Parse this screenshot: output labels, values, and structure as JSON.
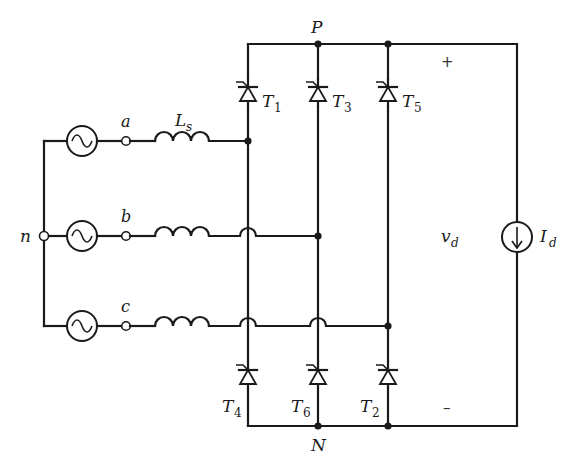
{
  "diagram": {
    "nodes": {
      "positive_rail": "P",
      "negative_rail": "N",
      "neutral": "n",
      "phase_a": "a",
      "phase_b": "b",
      "phase_c": "c"
    },
    "inductor": {
      "label_main": "L",
      "label_sub": "s"
    },
    "thyristors": [
      {
        "id": "T1",
        "main": "T",
        "sub": "1"
      },
      {
        "id": "T3",
        "main": "T",
        "sub": "3"
      },
      {
        "id": "T5",
        "main": "T",
        "sub": "5"
      },
      {
        "id": "T4",
        "main": "T",
        "sub": "4"
      },
      {
        "id": "T6",
        "main": "T",
        "sub": "6"
      },
      {
        "id": "T2",
        "main": "T",
        "sub": "2"
      }
    ],
    "output_voltage": {
      "main": "v",
      "sub": "d"
    },
    "load_current": {
      "main": "I",
      "sub": "d"
    },
    "polarity": {
      "plus": "+",
      "minus": "–"
    },
    "colors": {
      "wire": "#1a1a1a",
      "background": "#ffffff"
    }
  }
}
